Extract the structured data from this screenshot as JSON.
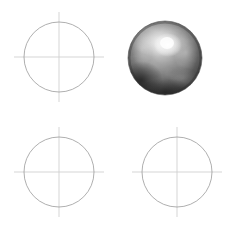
{
  "figure": {
    "width": 236,
    "height": 234,
    "background_color": "#ffffff",
    "layout": "2x2 grid of sphere rendering cells"
  },
  "colors": {
    "background": "#ffffff",
    "circle_stroke": "#9a9a9a",
    "crosshair_stroke": "#d0d0d0",
    "sphere_highlight": "#f2f2f2",
    "sphere_midtone": "#8c8c8c",
    "sphere_shadow": "#2a2a2a",
    "sphere_rim": "#3d3d3d"
  },
  "cells": [
    {
      "id": "cell-top-left",
      "kind": "wireframe",
      "position": "top-left",
      "center_x": 59,
      "center_y": 57,
      "radius": 35,
      "stroke_width": 0.8,
      "crosshair_overhang": 10
    },
    {
      "id": "cell-top-right",
      "kind": "shaded-sphere",
      "position": "top-right",
      "center_x": 165,
      "center_y": 58,
      "radius": 37,
      "highlight_x": 168,
      "highlight_y": 45,
      "highlight_radius": 13,
      "material": "brushed metal",
      "shading": "specular with mottled reflections"
    },
    {
      "id": "cell-bottom-left",
      "kind": "wireframe",
      "position": "bottom-left",
      "center_x": 59,
      "center_y": 172,
      "radius": 35,
      "stroke_width": 0.8,
      "crosshair_overhang": 10
    },
    {
      "id": "cell-bottom-right",
      "kind": "wireframe",
      "position": "bottom-right",
      "center_x": 177,
      "center_y": 172,
      "radius": 35,
      "stroke_width": 0.8,
      "crosshair_overhang": 10
    }
  ]
}
